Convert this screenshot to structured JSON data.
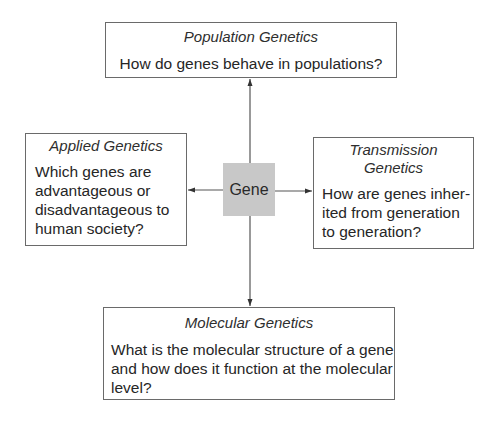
{
  "diagram": {
    "center": {
      "label": "Gene",
      "fill_color": "#c8c8c8"
    },
    "nodes": {
      "population": {
        "title": "Population Genetics",
        "question_lines": [
          "How do genes behave in populations?"
        ],
        "position": "top"
      },
      "applied": {
        "title": "Applied Genetics",
        "question_lines": [
          "Which genes are",
          "advantageous or",
          "disadvantageous to",
          "human society?"
        ],
        "position": "left"
      },
      "transmission": {
        "title_lines": [
          "Transmission",
          "Genetics"
        ],
        "question_lines": [
          "How are genes inher-",
          "ited from generation",
          "to generation?"
        ],
        "position": "right"
      },
      "molecular": {
        "title": "Molecular Genetics",
        "question_lines": [
          "What is the molecular structure of a gene",
          "and how does it function at the molecular",
          "level?"
        ],
        "position": "bottom"
      }
    },
    "edges": [
      {
        "from": "Gene",
        "to": "Population Genetics",
        "direction": "up",
        "arrow": "arrow-up-icon"
      },
      {
        "from": "Gene",
        "to": "Applied Genetics",
        "direction": "left",
        "arrow": "arrow-left-icon"
      },
      {
        "from": "Gene",
        "to": "Transmission Genetics",
        "direction": "right",
        "arrow": "arrow-right-icon"
      },
      {
        "from": "Gene",
        "to": "Molecular Genetics",
        "direction": "down",
        "arrow": "arrow-down-icon"
      }
    ],
    "line_color": "#555555",
    "border_color": "#6a6a6a"
  }
}
